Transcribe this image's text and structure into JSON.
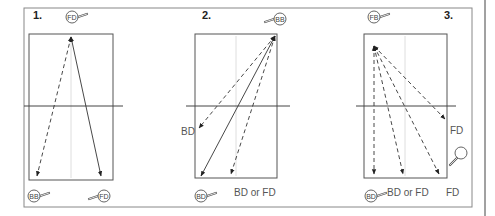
{
  "figure": {
    "frame": {
      "x": 24,
      "y": 8,
      "w": 448,
      "h": 199
    },
    "right_rule_x": 485,
    "colors": {
      "line": "#333333",
      "frame": "#888888",
      "table": "#555555",
      "net": "#444444",
      "center": "#cccccc",
      "text": "#555555"
    }
  },
  "panels": [
    {
      "number": "1.",
      "number_pos": [
        33,
        19
      ],
      "table": {
        "x": 29,
        "y": 34,
        "w": 84,
        "h": 146
      },
      "net_y": 106,
      "net_x": [
        24,
        123
      ],
      "center_x": 71,
      "paddles": [
        {
          "label": "FD",
          "x": 72,
          "y": 17,
          "handle": "right"
        },
        {
          "label": "BB",
          "x": 34,
          "y": 196,
          "handle": "right"
        },
        {
          "label": "FD",
          "x": 104,
          "y": 196,
          "handle": "left"
        }
      ],
      "arrows": [
        {
          "from": [
            71,
            37
          ],
          "to": [
            37,
            176
          ],
          "style": "dashed",
          "heads": "both"
        },
        {
          "from": [
            71,
            37
          ],
          "to": [
            101,
            176
          ],
          "style": "solid",
          "heads": "both"
        }
      ],
      "texts": []
    },
    {
      "number": "2.",
      "number_pos": [
        202,
        19
      ],
      "table": {
        "x": 195,
        "y": 34,
        "w": 82,
        "h": 144
      },
      "net_y": 106,
      "net_x": [
        186,
        290
      ],
      "center_x": 236,
      "paddles": [
        {
          "label": "BB",
          "x": 280,
          "y": 19,
          "handle": "left"
        },
        {
          "label": "BD",
          "x": 201,
          "y": 196,
          "handle": "right"
        }
      ],
      "arrows": [
        {
          "from": [
            275,
            36
          ],
          "to": [
            199,
            128
          ],
          "style": "dashed",
          "heads": "both"
        },
        {
          "from": [
            275,
            36
          ],
          "to": [
            201,
            176
          ],
          "style": "solid",
          "heads": "both"
        },
        {
          "from": [
            275,
            36
          ],
          "to": [
            231,
            174
          ],
          "style": "dashed",
          "heads": "both"
        }
      ],
      "texts": [
        {
          "text": "BD",
          "x": 181,
          "y": 135
        },
        {
          "text": "BD or FD",
          "x": 234,
          "y": 196
        }
      ]
    },
    {
      "number": "3.",
      "number_pos": [
        444,
        19
      ],
      "table": {
        "x": 364,
        "y": 34,
        "w": 83,
        "h": 144
      },
      "net_y": 106,
      "net_x": [
        356,
        456
      ],
      "center_x": 405,
      "paddles": [
        {
          "label": "FB",
          "x": 374,
          "y": 17,
          "handle": "right"
        },
        {
          "label": "BD",
          "x": 371,
          "y": 196,
          "handle": "right"
        },
        {
          "label": "",
          "x": 461,
          "y": 153,
          "handle": "down-left"
        }
      ],
      "arrows": [
        {
          "from": [
            374,
            46
          ],
          "to": [
            374,
            174
          ],
          "style": "dashed",
          "heads": "both"
        },
        {
          "from": [
            374,
            46
          ],
          "to": [
            403,
            174
          ],
          "style": "dashed",
          "heads": "both"
        },
        {
          "from": [
            374,
            46
          ],
          "to": [
            439,
            174
          ],
          "style": "dashed",
          "heads": "both"
        },
        {
          "from": [
            374,
            46
          ],
          "to": [
            445,
            119
          ],
          "style": "dashed",
          "heads": "both"
        }
      ],
      "texts": [
        {
          "text": "FD",
          "x": 450,
          "y": 134
        },
        {
          "text": "BD or FD",
          "x": 387,
          "y": 196
        },
        {
          "text": "FD",
          "x": 446,
          "y": 196
        }
      ]
    }
  ]
}
